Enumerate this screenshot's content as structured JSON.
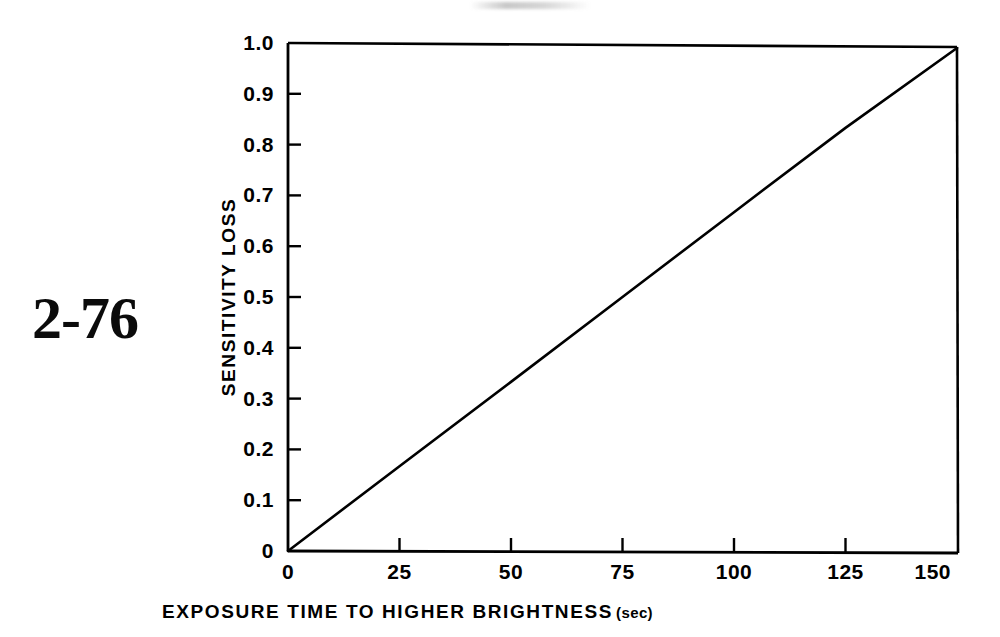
{
  "figure": {
    "number": "2-76"
  },
  "chart_data": {
    "type": "line",
    "title": "",
    "subtitle": "",
    "xlabel": "EXPOSURE TIME TO HIGHER BRIGHTNESS",
    "xlabel_units": "(sec)",
    "ylabel": "SENSITIVITY LOSS",
    "xlim": [
      0,
      150
    ],
    "ylim": [
      0,
      1.0
    ],
    "grid": false,
    "legend": null,
    "x_ticks": [
      0,
      25,
      50,
      75,
      100,
      125,
      150
    ],
    "x_tick_labels": [
      "0",
      "25",
      "50",
      "75",
      "100",
      "125",
      "150"
    ],
    "y_ticks": [
      0,
      0.1,
      0.2,
      0.3,
      0.4,
      0.5,
      0.6,
      0.7,
      0.8,
      0.9,
      1.0
    ],
    "y_tick_labels": [
      "0",
      "0.1",
      "0.2",
      "0.3",
      "0.4",
      "0.5",
      "0.6",
      "0.7",
      "0.8",
      "0.9",
      "1.0"
    ],
    "tick_direction": "in",
    "series": [
      {
        "name": "sensitivity loss",
        "x": [
          0,
          25,
          50,
          75,
          100,
          125,
          150
        ],
        "values": [
          0.0,
          0.167,
          0.333,
          0.5,
          0.667,
          0.833,
          1.0
        ],
        "color": "#000000",
        "style": "solid"
      }
    ],
    "annotations": []
  },
  "style": {
    "background": "#ffffff",
    "ink": "#000000",
    "axis_color": "#000000"
  }
}
